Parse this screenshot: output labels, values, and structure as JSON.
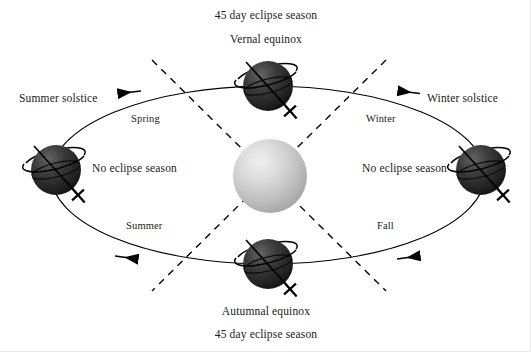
{
  "diagram": {
    "type": "orbital-diagram",
    "colors": {
      "background": "#ffffff",
      "sun_light": "#f0f0f0",
      "sun_mid": "#c8c8c8",
      "sun_dark": "#9a9a9a",
      "earth_light": "#6e6e6e",
      "earth_dark": "#1c1c1c",
      "line": "#000000",
      "text": "#1a1a1a"
    },
    "labels": {
      "top_eclipse_season": "45 day eclipse season",
      "vernal_equinox": "Vernal equinox",
      "summer_solstice": "Summer solstice",
      "winter_solstice": "Winter solstice",
      "spring": "Spring",
      "winter": "Winter",
      "summer": "Summer",
      "fall": "Fall",
      "no_eclipse_season_left": "No eclipse season",
      "no_eclipse_season_right": "No eclipse season",
      "autumnal_equinox": "Autumnal equinox",
      "bottom_eclipse_season": "45 day eclipse season"
    },
    "bodies": {
      "sun": {
        "name": "sun",
        "cx": 270,
        "cy": 176,
        "r": 37
      },
      "earths": [
        {
          "name": "earth-vernal-equinox",
          "position": "top",
          "cx": 268,
          "cy": 86,
          "r": 25
        },
        {
          "name": "earth-summer-solstice",
          "position": "left",
          "cx": 56,
          "cy": 170,
          "r": 25
        },
        {
          "name": "earth-winter-solstice",
          "position": "right",
          "cx": 481,
          "cy": 170,
          "r": 25
        },
        {
          "name": "earth-autumnal-equinox",
          "position": "bottom",
          "cx": 268,
          "cy": 264,
          "r": 25
        }
      ]
    },
    "orbit": {
      "name": "orbit-ellipse",
      "cx": 268,
      "cy": 175,
      "rx": 217,
      "ry": 89,
      "direction_arrows": [
        {
          "name": "orbit-arrow-spring",
          "direction": "left",
          "x": 130,
          "y": 92
        },
        {
          "name": "orbit-arrow-winter",
          "direction": "left",
          "x": 410,
          "y": 92
        },
        {
          "name": "orbit-arrow-summer",
          "direction": "right",
          "x": 126,
          "y": 258
        },
        {
          "name": "orbit-arrow-fall",
          "direction": "right",
          "x": 408,
          "y": 258
        }
      ]
    },
    "node_lines": [
      {
        "name": "node-line-ascending",
        "x1": 152,
        "y1": 60,
        "x2": 386,
        "y2": 291
      },
      {
        "name": "node-line-descending",
        "x1": 386,
        "y1": 60,
        "x2": 152,
        "y2": 291
      }
    ]
  }
}
